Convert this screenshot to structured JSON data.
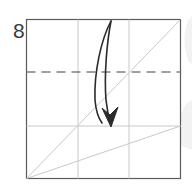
{
  "figure": {
    "step_label": "8",
    "type": "origami-fold-diagram",
    "colors": {
      "paper_outline": "#5a5a5a",
      "grid_line": "#c9c9c9",
      "crease_diagonal": "#c9c9c9",
      "fold_line_dashed": "#808080",
      "arrow": "#2b2b2b",
      "step_number": "#3a3a3a",
      "background": "#ffffff",
      "watermark": "#f2f2f2"
    },
    "paper": {
      "shape": "square",
      "x": 26,
      "y": 19,
      "width": 154,
      "height": 159
    },
    "grid": {
      "vertical_lines": [
        78,
        129
      ],
      "horizontal_lines": [
        126
      ],
      "divisions": 3
    },
    "fold_line": {
      "style": "dashed",
      "orientation": "horizontal",
      "y": 72,
      "x1": 26,
      "x2": 180,
      "dash_pattern": "9 6"
    },
    "creases": [
      {
        "name": "main-diagonal",
        "x1": 26,
        "y1": 178,
        "x2": 180,
        "y2": 19
      },
      {
        "name": "shallow-diagonal",
        "x1": 26,
        "y1": 178,
        "x2": 180,
        "y2": 126
      }
    ],
    "arrow": {
      "name": "valley-fold-arrow",
      "direction": "down",
      "start_x": 112,
      "start_y": 20,
      "end_x": 110,
      "end_y": 126,
      "style": "curved-lens-double-stroke"
    }
  }
}
